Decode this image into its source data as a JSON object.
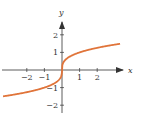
{
  "chart_data": {
    "type": "line",
    "title": "",
    "function": "y = x^(1/3)",
    "xlabel": "x",
    "ylabel": "y",
    "xlim": [
      -3,
      3
    ],
    "ylim": [
      -2.5,
      2.5
    ],
    "x_ticks": [
      -2,
      -1,
      1,
      2
    ],
    "x_tick_labels": [
      "−2",
      "−1",
      "1",
      "2"
    ],
    "y_ticks": [
      -2,
      -1,
      1,
      2
    ],
    "y_tick_labels": [
      "−2",
      "−1",
      "1",
      "2"
    ],
    "grid": false,
    "series": [
      {
        "name": "cube root",
        "color": "#e0743a",
        "x": [
          -3,
          -2,
          -1,
          -0.5,
          -0.1,
          0,
          0.1,
          0.5,
          1,
          2,
          3
        ],
        "y": [
          -1.44,
          -1.26,
          -1,
          -0.79,
          -0.46,
          0,
          0.46,
          0.79,
          1,
          1.26,
          1.44
        ]
      }
    ]
  },
  "axes": {
    "x_label": "x",
    "y_label": "y",
    "axis_color": "#333333"
  }
}
